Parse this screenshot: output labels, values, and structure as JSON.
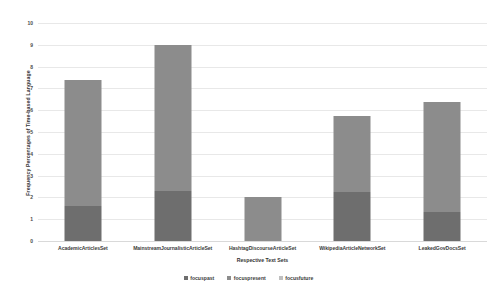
{
  "chart_data": {
    "type": "bar",
    "stacked": true,
    "title": "",
    "xlabel": "Respective Text Sets",
    "ylabel": "Frequency Percentages of Time-based Language",
    "categories": [
      "AcademicArticlesSet",
      "MainstreamJournalisticArticleSet",
      "HashtagDiscourseArticleSet",
      "WikipediaArticleNetworkSet",
      "LeakedGovDocsSet"
    ],
    "series": [
      {
        "name": "focuspast",
        "color": "#6E6E6E",
        "values": [
          1.6,
          2.3,
          0.0,
          2.25,
          1.35
        ]
      },
      {
        "name": "focuspresent",
        "color": "#8C8C8C",
        "values": [
          5.8,
          6.7,
          2.0,
          3.5,
          5.05
        ]
      },
      {
        "name": "focusfuture",
        "color": "#BFBFBF",
        "values": [
          0.0,
          0.0,
          0.0,
          0.0,
          0.0
        ]
      }
    ],
    "totals": [
      7.4,
      9.0,
      2.0,
      5.75,
      6.4
    ],
    "ylim": [
      0,
      10
    ],
    "yticks": [
      "0",
      "1",
      "2",
      "3",
      "4",
      "5",
      "6",
      "7",
      "8",
      "9",
      "10"
    ],
    "grid": true,
    "legend_position": "bottom",
    "plot_background": "#FFFFFF",
    "gridline_color": "#E8E8E8"
  }
}
